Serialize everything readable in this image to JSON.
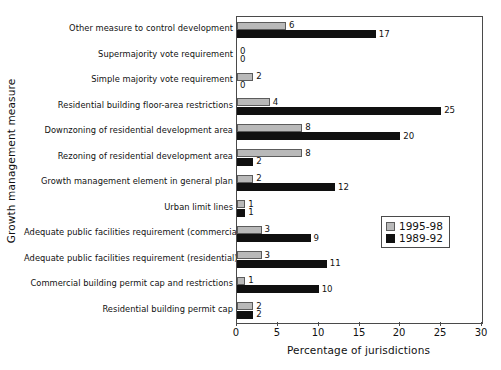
{
  "chart_data": {
    "type": "bar",
    "orientation": "horizontal",
    "title": "",
    "xlabel": "Percentage of jurisdictions",
    "ylabel": "Growth management measure",
    "xlim": [
      0,
      30
    ],
    "xticks": [
      0,
      5,
      10,
      15,
      20,
      25,
      30
    ],
    "grid": false,
    "legend_position": "middle-right-inside",
    "categories": [
      "Other measure to control development",
      "Supermajority vote requirement",
      "Simple majority vote requirement",
      "Residential building floor-area restrictions",
      "Downzoning of residential development area",
      "Rezoning of residential development area",
      "Growth management element in general plan",
      "Urban limit lines",
      "Adequate public facilities requirement (commercial)",
      "Adequate public facilities requirement (residential)",
      "Commercial building permit cap and restrictions",
      "Residential building permit cap"
    ],
    "series": [
      {
        "name": "1995-98",
        "color": "#b9b9b9",
        "values": [
          6,
          0,
          2,
          4,
          8,
          8,
          2,
          1,
          3,
          3,
          1,
          2
        ]
      },
      {
        "name": "1989-92",
        "color": "#101010",
        "values": [
          17,
          0,
          0,
          25,
          20,
          2,
          12,
          1,
          9,
          11,
          10,
          2
        ]
      }
    ],
    "value_labels": {
      "1995-98": [
        "6",
        "0",
        "2",
        "4",
        "8",
        "8",
        "2",
        "1",
        "3",
        "3",
        "1",
        "2"
      ],
      "1989-92": [
        "17",
        "0",
        "0",
        "25",
        "20",
        "2",
        "12",
        "1",
        "9",
        "11",
        "10",
        "2"
      ]
    }
  },
  "legend": {
    "entries": [
      {
        "label": "1995-98"
      },
      {
        "label": "1989-92"
      }
    ]
  },
  "axes": {
    "x_tick_labels": [
      "0",
      "5",
      "10",
      "15",
      "20",
      "25",
      "30"
    ]
  }
}
